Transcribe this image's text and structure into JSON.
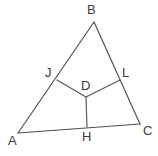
{
  "figure": {
    "width": 158,
    "height": 156,
    "background_color": "#ffffff",
    "stroke_color": "#4d4d52",
    "label_color": "#3a3a3f",
    "points": {
      "A": {
        "label": "A",
        "x": 18,
        "y": 133,
        "label_x": 8,
        "label_y": 134
      },
      "B": {
        "label": "B",
        "x": 94,
        "y": 22,
        "label_x": 87,
        "label_y": 3
      },
      "C": {
        "label": "C",
        "x": 140,
        "y": 124,
        "label_x": 143,
        "label_y": 124
      },
      "D": {
        "label": "D",
        "x": 86,
        "y": 97,
        "label_x": 81,
        "label_y": 79
      },
      "H": {
        "label": "H",
        "x": 87,
        "y": 127,
        "label_x": 82,
        "label_y": 130
      },
      "J": {
        "label": "J",
        "x": 57,
        "y": 80,
        "label_x": 45,
        "label_y": 66
      },
      "L": {
        "label": "L",
        "x": 120,
        "y": 80,
        "label_x": 122,
        "label_y": 66
      }
    },
    "segments": [
      {
        "name": "side-AB",
        "from": "A",
        "to": "B"
      },
      {
        "name": "side-BC",
        "from": "B",
        "to": "C"
      },
      {
        "name": "side-AC",
        "from": "A",
        "to": "C"
      },
      {
        "name": "segment-JD",
        "from": "J",
        "to": "D"
      },
      {
        "name": "segment-DL",
        "from": "D",
        "to": "L"
      },
      {
        "name": "segment-DH",
        "from": "D",
        "to": "H"
      }
    ]
  },
  "chart_data": {
    "type": "diagram",
    "vertices": [
      "A",
      "B",
      "C"
    ],
    "interior_points": [
      "D"
    ],
    "points_on_sides": {
      "J": "on side AB",
      "L": "on side BC",
      "H": "on side AC"
    },
    "coordinates": {
      "A": [
        18,
        133
      ],
      "B": [
        94,
        22
      ],
      "C": [
        140,
        124
      ],
      "D": [
        86,
        97
      ],
      "H": [
        87,
        127
      ],
      "J": [
        57,
        80
      ],
      "L": [
        120,
        80
      ]
    },
    "edges": [
      [
        "A",
        "B"
      ],
      [
        "B",
        "C"
      ],
      [
        "A",
        "C"
      ],
      [
        "J",
        "D"
      ],
      [
        "D",
        "L"
      ],
      [
        "D",
        "H"
      ]
    ]
  }
}
